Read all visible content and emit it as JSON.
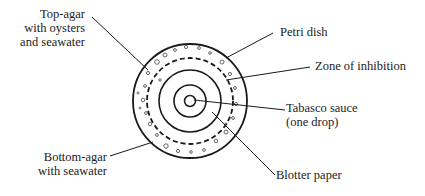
{
  "diagram": {
    "type": "petri-dish-assay",
    "labels": {
      "top_agar": [
        "Top-agar",
        "with oysters",
        "and seawater"
      ],
      "bottom_agar": [
        "Bottom-agar",
        "with seawater"
      ],
      "petri_dish": "Petri dish",
      "zone_of_inhibition": "Zone of inhibition",
      "tabasco": [
        "Tabasco sauce",
        "(one drop)"
      ],
      "blotter_paper": "Blotter paper"
    },
    "colors": {
      "stroke": "#1a1a1a",
      "speckle": "#555555",
      "background": "#ffffff"
    }
  }
}
